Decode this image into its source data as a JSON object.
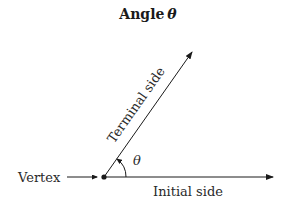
{
  "diagram": {
    "title": "Angle",
    "title_symbol": "θ",
    "labels": {
      "vertex": "Vertex",
      "initial_side": "Initial side",
      "terminal_side": "Terminal side",
      "angle": "θ"
    },
    "colors": {
      "stroke": "#1a1a1a",
      "text": "#2a2a2a",
      "background": "#ffffff"
    }
  }
}
